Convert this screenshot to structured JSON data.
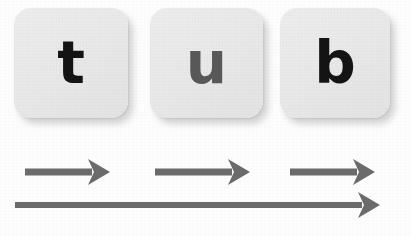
{
  "scene": {
    "background_color": "#fdfdfd",
    "description": "Three letter tiles spelling tub with arrows beneath"
  },
  "tiles": [
    {
      "letter": "t",
      "color": "#141414",
      "tile_color": "#e9e9e9",
      "x": 14,
      "y": 8,
      "w": 114,
      "h": 110,
      "name": "letter-tile-t"
    },
    {
      "letter": "u",
      "color": "#585858",
      "tile_color": "#e9e9e9",
      "x": 150,
      "y": 8,
      "w": 113,
      "h": 110,
      "name": "letter-tile-u"
    },
    {
      "letter": "b",
      "color": "#141414",
      "tile_color": "#e9e9e9",
      "x": 280,
      "y": 8,
      "w": 110,
      "h": 110,
      "name": "letter-tile-b"
    }
  ],
  "word": "tub",
  "arrows": {
    "color": "#6b6b6b",
    "segment_arrows": [
      {
        "name": "segment-arrow-1",
        "x1": 25,
        "x2": 110,
        "y": 172,
        "thickness": 7
      },
      {
        "name": "segment-arrow-2",
        "x1": 155,
        "x2": 250,
        "y": 172,
        "thickness": 7
      },
      {
        "name": "segment-arrow-3",
        "x1": 290,
        "x2": 375,
        "y": 172,
        "thickness": 7
      }
    ],
    "blend_arrow": {
      "name": "blend-arrow",
      "x1": 15,
      "x2": 380,
      "y": 205,
      "thickness": 6
    }
  }
}
